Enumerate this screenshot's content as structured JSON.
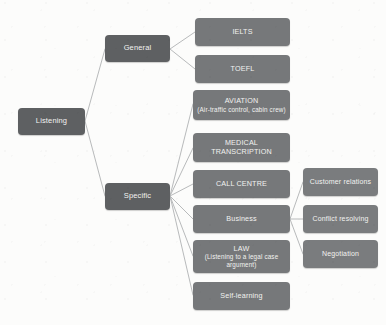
{
  "diagram": {
    "type": "tree-diagram",
    "background_color": "#fcfcfb",
    "node_colors": {
      "root": "#5e6062",
      "branch": "#5e6062",
      "leaf": "#76787a",
      "sub_leaf": "#7a7c7e"
    },
    "connector_color": "#b7b9ba",
    "nodes": {
      "root": {
        "label": "Listening"
      },
      "general": {
        "label": "General"
      },
      "specific": {
        "label": "Specific"
      },
      "ielts": {
        "label": "IELTS"
      },
      "toefl": {
        "label": "TOEFL"
      },
      "aviation": {
        "label": "AVIATION",
        "sub": "(Air-traffic control, cabin crew)"
      },
      "medical": {
        "label": "MEDICAL TRANSCRIPTION"
      },
      "call_centre": {
        "label": "CALL CENTRE"
      },
      "business": {
        "label": "Business"
      },
      "law": {
        "label": "LAW",
        "sub": "(Listening to a legal case argument)"
      },
      "self_learning": {
        "label": "Self-learning"
      },
      "customer_relations": {
        "label": "Customer relations"
      },
      "conflict_resolving": {
        "label": "Conflict resolving"
      },
      "negotiation": {
        "label": "Negotiation"
      }
    },
    "edges": [
      {
        "from": "root",
        "to": "general"
      },
      {
        "from": "root",
        "to": "specific"
      },
      {
        "from": "general",
        "to": "ielts"
      },
      {
        "from": "general",
        "to": "toefl"
      },
      {
        "from": "specific",
        "to": "aviation"
      },
      {
        "from": "specific",
        "to": "medical"
      },
      {
        "from": "specific",
        "to": "call_centre"
      },
      {
        "from": "specific",
        "to": "business"
      },
      {
        "from": "specific",
        "to": "law"
      },
      {
        "from": "specific",
        "to": "self_learning"
      },
      {
        "from": "business",
        "to": "customer_relations"
      },
      {
        "from": "business",
        "to": "conflict_resolving"
      },
      {
        "from": "business",
        "to": "negotiation"
      }
    ]
  }
}
